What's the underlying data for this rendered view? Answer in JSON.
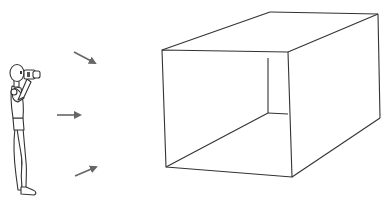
{
  "diagram": {
    "elements": {
      "person": {
        "label": "photographer",
        "holding": "camera"
      },
      "arrows": [
        {
          "direction": "down-right"
        },
        {
          "direction": "right"
        },
        {
          "direction": "up-right"
        }
      ],
      "box": {
        "label": "open rectangular box",
        "open_face": "front"
      }
    },
    "colors": {
      "line": "#333333",
      "arrow": "#666666",
      "background": "#ffffff"
    }
  }
}
